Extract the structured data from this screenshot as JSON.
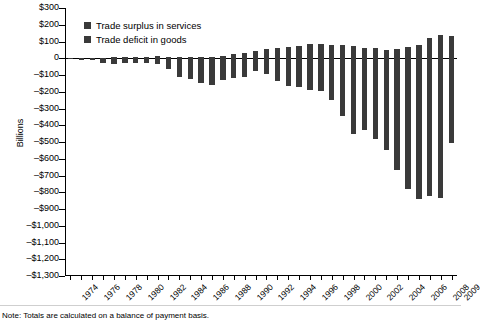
{
  "chart_data": {
    "type": "bar",
    "title": "",
    "subtitle": "",
    "xlabel": "",
    "ylabel": "Billions",
    "ylim": [
      -1300,
      300
    ],
    "ytick_step": 100,
    "grid": false,
    "legend_position": "top-left",
    "note": "Note: Totals are calculated on a balance of payment basis.",
    "ytick_labels": [
      "$300",
      "$200",
      "$100",
      "0",
      "–$100",
      "–$200",
      "–$300",
      "–$400",
      "–$500",
      "–$600",
      "–$700",
      "–$800",
      "–$900",
      "–$1,000",
      "–$1,100",
      "–$1,200",
      "–$1,300"
    ],
    "ytick_values": [
      300,
      200,
      100,
      0,
      -100,
      -200,
      -300,
      -400,
      -500,
      -600,
      -700,
      -800,
      -900,
      -1000,
      -1100,
      -1200,
      -1300
    ],
    "xtick_labels": [
      "1974",
      "1976",
      "1978",
      "1980",
      "1982",
      "1984",
      "1986",
      "1988",
      "1990",
      "1992",
      "1994",
      "1996",
      "1998",
      "2000",
      "2002",
      "2004",
      "2006",
      "2008",
      "2009"
    ],
    "categories": [
      1974,
      1975,
      1976,
      1977,
      1978,
      1979,
      1980,
      1981,
      1982,
      1983,
      1984,
      1985,
      1986,
      1987,
      1988,
      1989,
      1990,
      1991,
      1992,
      1993,
      1994,
      1995,
      1996,
      1997,
      1998,
      1999,
      2000,
      2001,
      2002,
      2003,
      2004,
      2005,
      2006,
      2007,
      2008,
      2009
    ],
    "series": [
      {
        "name": "Trade surplus in services",
        "color": "#3a3a3a",
        "values": [
          3,
          4,
          4,
          4,
          5,
          7,
          8,
          10,
          11,
          9,
          5,
          6,
          8,
          8,
          15,
          28,
          30,
          44,
          56,
          60,
          67,
          73,
          83,
          86,
          78,
          80,
          71,
          63,
          61,
          52,
          54,
          66,
          79,
          119,
          136,
          132
        ]
      },
      {
        "name": "Trade deficit in goods",
        "color": "#3a3a3a",
        "values": [
          -6,
          -9,
          -9,
          -31,
          -34,
          -28,
          -26,
          -28,
          -36,
          -67,
          -113,
          -122,
          -145,
          -160,
          -127,
          -115,
          -111,
          -77,
          -97,
          -133,
          -166,
          -174,
          -191,
          -198,
          -248,
          -346,
          -452,
          -427,
          -482,
          -547,
          -666,
          -783,
          -838,
          -823,
          -835,
          -507
        ]
      }
    ]
  },
  "legend": {
    "items": [
      {
        "label": "Trade surplus in services",
        "color": "#3a3a3a"
      },
      {
        "label": "Trade deficit in goods",
        "color": "#3a3a3a"
      }
    ]
  },
  "axis": {
    "y_title": "Billions"
  },
  "footer": {
    "note": "Note: Totals are calculated on a balance of payment basis."
  }
}
